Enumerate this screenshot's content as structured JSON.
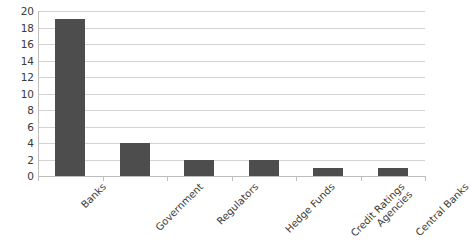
{
  "chart_data": {
    "type": "bar",
    "title": "",
    "subtitle": "",
    "xlabel": "",
    "ylabel": "",
    "categories": [
      "Banks",
      "Government",
      "Regulators",
      "Hedge Funds",
      "Credit Ratings Agencies",
      "Central Banks"
    ],
    "category_lines": [
      [
        "Banks"
      ],
      [
        "Government"
      ],
      [
        "Regulators"
      ],
      [
        "Hedge Funds"
      ],
      [
        "Credit Ratings",
        "Agencies"
      ],
      [
        "Central Banks"
      ]
    ],
    "values": [
      19,
      4,
      2,
      2,
      1,
      1
    ],
    "ylim": [
      0,
      20
    ],
    "ytick_step": 2,
    "yticks": [
      20,
      18,
      16,
      14,
      12,
      10,
      8,
      6,
      4,
      2,
      0
    ],
    "ytick_labels": [
      "20",
      "18",
      "16",
      "14",
      "12",
      "10",
      "8",
      "6",
      "4",
      "2",
      "0"
    ],
    "grid": true,
    "grid_axis": "y",
    "legend": false,
    "legend_position": "none",
    "bar_color": "#4d4d4d",
    "gridline_color": "#d3d3d3",
    "axis_color": "#bdbdbd",
    "background_color": "#ffffff",
    "label_rotation_deg": -45
  }
}
